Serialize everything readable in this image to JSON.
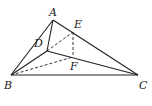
{
  "diagram": {
    "type": "geometry",
    "labels": {
      "A": "A",
      "B": "B",
      "C": "C",
      "D": "D",
      "E": "E",
      "F": "F"
    },
    "solid_segments": [
      "AB",
      "AC",
      "BC",
      "AD",
      "BD",
      "DC"
    ],
    "dashed_segments": [
      "DE",
      "EF",
      "BF"
    ]
  }
}
